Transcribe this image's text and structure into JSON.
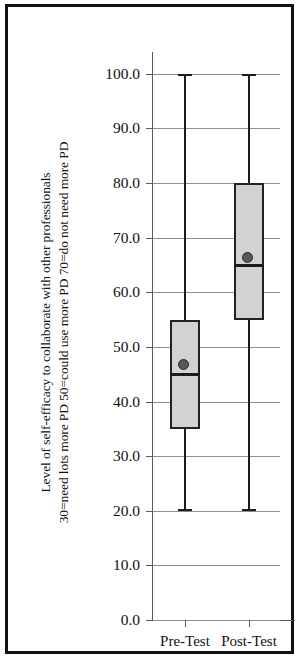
{
  "figure": {
    "background": "#ffffff",
    "frame_color": "#111111"
  },
  "chart_data": {
    "type": "box",
    "title": "",
    "xlabel": "",
    "ylabel_line1": "Level of self-efficacy to collaborate with other professionals",
    "ylabel_line2": "30=need lots more PD   50=could use more PD   70=do not need more PD",
    "categories": [
      "Pre-Test",
      "Post-Test"
    ],
    "ylim": [
      0.0,
      104.0
    ],
    "yticks": [
      0.0,
      10.0,
      20.0,
      30.0,
      40.0,
      50.0,
      60.0,
      70.0,
      80.0,
      90.0,
      100.0
    ],
    "ytick_labels": [
      "0.0",
      "10.0",
      "20.0",
      "30.0",
      "40.0",
      "50.0",
      "60.0",
      "70.0",
      "80.0",
      "90.0",
      "100.0"
    ],
    "grid": true,
    "legend": "none",
    "box_fill": "#d2d2d2",
    "box_edge": "#222222",
    "mean_marker_color": "#595959",
    "series": [
      {
        "name": "Pre-Test",
        "whisker_low": 20.0,
        "q1": 35.0,
        "median": 45.0,
        "q3": 55.0,
        "whisker_high": 100.0,
        "mean": 46.5
      },
      {
        "name": "Post-Test",
        "whisker_low": 20.0,
        "q1": 55.0,
        "median": 65.0,
        "q3": 80.0,
        "whisker_high": 100.0,
        "mean": 66.0
      }
    ]
  }
}
